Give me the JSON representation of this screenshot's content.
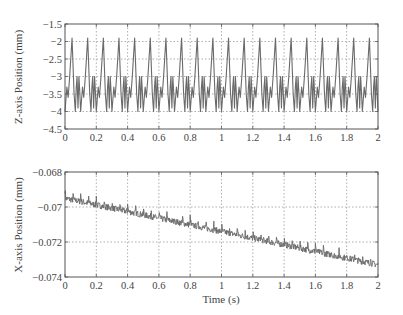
{
  "chart_data": [
    {
      "type": "line",
      "title": "",
      "xlabel": "",
      "ylabel": "Z-axis Position (mm)",
      "xlim": [
        0,
        2
      ],
      "ylim": [
        -4.5,
        -1.5
      ],
      "grid": true,
      "xticks": [
        0,
        0.2,
        0.4,
        0.6,
        0.8,
        1,
        1.2,
        1.4,
        1.6,
        1.8,
        2
      ],
      "xtick_labels": [
        "0",
        "0.2",
        "0.4",
        "0.6",
        "0.8",
        "1",
        "1.2",
        "1.4",
        "1.6",
        "1.8",
        "2"
      ],
      "yticks": [
        -1.5,
        -2,
        -2.5,
        -3,
        -3.5,
        -4,
        -4.5
      ],
      "ytick_labels": [
        "−1.5",
        "−2",
        "−2.5",
        "−3",
        "−3.5",
        "−4",
        "−4.5"
      ],
      "series": [
        {
          "name": "Z position",
          "periodic": true,
          "period": 0.1,
          "periods": 20,
          "one_period": {
            "t": [
              0.0,
              0.012,
              0.02,
              0.03,
              0.045,
              0.058,
              0.066,
              0.072,
              0.077,
              0.083,
              0.089,
              0.094,
              0.1
            ],
            "y": [
              -4.0,
              -3.3,
              -3.6,
              -3.0,
              -1.9,
              -3.5,
              -4.0,
              -3.3,
              -3.0,
              -3.9,
              -3.0,
              -3.4,
              -4.0
            ]
          }
        }
      ]
    },
    {
      "type": "line",
      "title": "",
      "xlabel": "Time (s)",
      "ylabel": "X-axis Position (mm)",
      "xlim": [
        0,
        2
      ],
      "ylim": [
        -0.074,
        -0.068
      ],
      "grid": true,
      "xticks": [
        0,
        0.2,
        0.4,
        0.6,
        0.8,
        1,
        1.2,
        1.4,
        1.6,
        1.8,
        2
      ],
      "xtick_labels": [
        "0",
        "0.2",
        "0.4",
        "0.6",
        "0.8",
        "1",
        "1.2",
        "1.4",
        "1.6",
        "1.8",
        "2"
      ],
      "yticks": [
        -0.068,
        -0.07,
        -0.072,
        -0.074
      ],
      "ytick_labels": [
        "−0.068",
        "−0.07",
        "−0.072",
        "−0.074"
      ],
      "series": [
        {
          "name": "X position",
          "trend": {
            "t": [
              0,
              2
            ],
            "y": [
              -0.0695,
              -0.0733
            ]
          },
          "spike_period": 0.05,
          "spike_height": 0.00045,
          "noise_amplitude": 0.00018
        }
      ]
    }
  ],
  "plots": [
    {
      "ylabel": "Z-axis Position (mm)"
    },
    {
      "ylabel": "X-axis Position (mm)",
      "xlabel": "Time (s)"
    }
  ],
  "colors": {
    "line": "#6a6a6a",
    "axes": "#555555",
    "grid": "#9a9a9a"
  }
}
